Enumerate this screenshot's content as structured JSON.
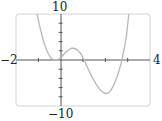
{
  "chart_data": {
    "type": "line",
    "title": "",
    "xlabel": "",
    "ylabel": "",
    "xlim": [
      -2,
      4
    ],
    "ylim": [
      -10,
      10
    ],
    "x_ticks_step": 1,
    "y_ticks_step": 2,
    "grid": false,
    "legend": "none",
    "labels": {
      "x_min": "−2",
      "x_max": "4",
      "y_max": "10",
      "y_min": "−10"
    },
    "series": [
      {
        "name": "f(x)",
        "x": [
          -1.06,
          -0.9,
          -0.75,
          -0.6,
          -0.45,
          -0.3,
          -0.15,
          0.0,
          0.15,
          0.3,
          0.5,
          0.7,
          0.9,
          1.05,
          1.2,
          1.4,
          1.6,
          1.8,
          2.0,
          2.15,
          2.25,
          2.4,
          2.55,
          2.7,
          2.85,
          2.95,
          3.05
        ],
        "y": [
          10,
          6.5,
          3.8,
          1.8,
          0.5,
          0.0,
          0.05,
          0.4,
          1.3,
          2.0,
          2.6,
          2.4,
          1.4,
          0.0,
          -1.6,
          -3.6,
          -5.4,
          -6.7,
          -7.3,
          -7.1,
          -6.6,
          -5.2,
          -3.3,
          -0.9,
          2.5,
          5.5,
          10
        ]
      }
    ],
    "colors": {
      "curve": "#b8b8b8",
      "axes": "#555555",
      "frame": "#d0d0d0"
    }
  }
}
